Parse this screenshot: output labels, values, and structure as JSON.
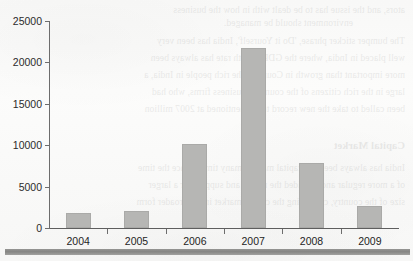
{
  "chart_data": {
    "type": "bar",
    "title": "",
    "subtitle": "",
    "xlabel": "",
    "ylabel": "",
    "categories": [
      "2004",
      "2005",
      "2006",
      "2007",
      "2008",
      "2009"
    ],
    "values": [
      1800,
      2100,
      10100,
      21700,
      7800,
      2600
    ],
    "ylim": [
      0,
      25000
    ],
    "ytick_labels": [
      "0",
      "5000",
      "10000",
      "15000",
      "20000",
      "25000"
    ],
    "ytick_values": [
      0,
      5000,
      10000,
      15000,
      20000,
      25000
    ],
    "grid": false,
    "legend": null,
    "legend_position": "none",
    "annotations": [],
    "bar_color": "#b6b6b4",
    "axis_color": "#6d6d6d",
    "background_color": "#fbfbfa"
  },
  "page": {
    "media": "scanned-document-page",
    "bleed_through_text": [
      "ators, and the issue has to be dealt with in how the business",
      "environment should be managed.",
      "The bumper sticker phrase, 'Do it Yourself', India has been very",
      "well placed in India, where the GDP growth rate has always been",
      "more important than growth in Country. The rich people in India, a",
      "large in the rich citizens of the country's business firms, who had",
      "been called to take the new record to be mentioned at 2007 million",
      "Capital Market",
      "India has always been the capital market, many times, since the time",
      "of a more regular and provided the rescue and support for a larger",
      "size of the country, comparing the capital market into a broader form"
    ]
  }
}
